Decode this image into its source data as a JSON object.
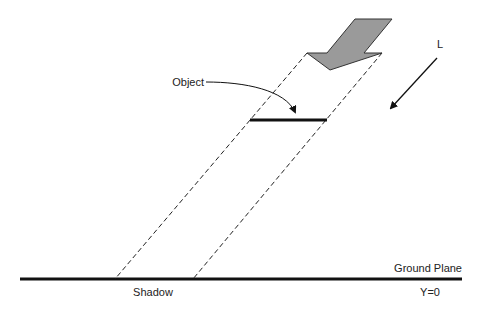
{
  "diagram": {
    "type": "shadow-projection",
    "labels": {
      "object": "Object",
      "light": "L",
      "ground_plane": "Ground Plane",
      "shadow": "Shadow",
      "ground_y": "Y=0"
    },
    "colors": {
      "light_arrow_fill": "#9a9a9a",
      "stroke": "#111111",
      "background": "#ffffff"
    }
  }
}
